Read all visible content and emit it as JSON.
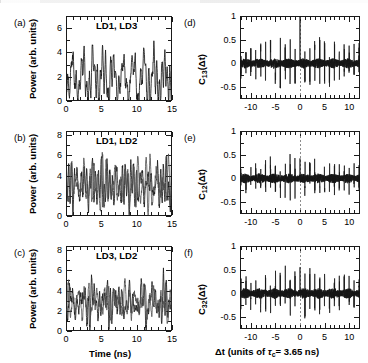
{
  "figure": {
    "background": "#ffffff",
    "trace_color": "#1a1a1a",
    "trace_color_secondary": "#4d4d4d",
    "axis_color": "#1a1a1a",
    "zero_line_color": "#8c8c8c"
  },
  "panels": [
    {
      "id": "a",
      "letter": "(a)",
      "inline_label": "LD1, LD3",
      "inline_label_bold_part": "LD1",
      "inline_label_rest": ", LD3",
      "ylabel": "Power (arb. units)",
      "yticks": [
        "0",
        "2",
        "4",
        "6"
      ],
      "ytick_values": [
        0,
        2,
        4,
        6
      ],
      "ylim": [
        0,
        7
      ],
      "xticks": [
        "0",
        "5",
        "10",
        "15"
      ],
      "xtick_values": [
        0,
        5,
        10,
        15
      ],
      "xlim": [
        0,
        15
      ],
      "xlabel": "",
      "n_traces": 1,
      "seed": 11,
      "mean": 1.9,
      "amp": 1.25
    },
    {
      "id": "b",
      "letter": "(b)",
      "inline_label": "LD1, LD2",
      "inline_label_bold_part": "LD1",
      "inline_label_rest": ", LD2",
      "ylabel": "Power (arb. units)",
      "yticks": [
        "0",
        "2",
        "4",
        "6",
        "8"
      ],
      "ytick_values": [
        0,
        2,
        4,
        6,
        8
      ],
      "ylim": [
        0,
        8.4
      ],
      "xticks": [
        "0",
        "5",
        "10",
        "15"
      ],
      "xtick_values": [
        0,
        5,
        10,
        15
      ],
      "xlim": [
        0,
        15
      ],
      "xlabel": "",
      "n_traces": 2,
      "seed": 23,
      "mean": 3.1,
      "amp": 1.3
    },
    {
      "id": "c",
      "letter": "(c)",
      "inline_label": "LD3, LD2",
      "inline_label_bold_part": "LD3",
      "inline_label_rest": ", LD2",
      "ylabel": "Power (arb. units)",
      "yticks": [
        "0",
        "2",
        "4",
        "6",
        "8"
      ],
      "ytick_values": [
        0,
        2,
        4,
        6,
        8
      ],
      "ylim": [
        0,
        8.4
      ],
      "xticks": [
        "0",
        "5",
        "10",
        "15"
      ],
      "xtick_values": [
        0,
        5,
        10,
        15
      ],
      "xlim": [
        0,
        15
      ],
      "xlabel": "Time (ns)",
      "n_traces": 2,
      "seed": 41,
      "mean": 2.85,
      "amp": 1.15
    },
    {
      "id": "d",
      "letter": "(d)",
      "inline_label": "",
      "ylabel_pre": "C",
      "ylabel_sub": "13",
      "ylabel_post": "(Δt)",
      "yticks": [
        "1",
        "0.5",
        "0",
        "-0.5"
      ],
      "ytick_values": [
        1,
        0.5,
        0,
        -0.5
      ],
      "ylim": [
        -0.75,
        1
      ],
      "xticks": [
        "-10",
        "-5",
        "0",
        "5",
        "10"
      ],
      "xtick_values": [
        -10,
        -5,
        0,
        5,
        10
      ],
      "xlim": [
        -12.2,
        12.2
      ],
      "xlabel": "",
      "seed": 7,
      "noise": 0.085,
      "center_peak": 0.98,
      "comb_period": 1.0,
      "comb_amp": 0.5
    },
    {
      "id": "e",
      "letter": "(e)",
      "inline_label": "",
      "ylabel_pre": "C",
      "ylabel_sub": "12",
      "ylabel_post": "(Δt)",
      "yticks": [
        "1",
        "0.5",
        "0",
        "-0.5"
      ],
      "ytick_values": [
        1,
        0.5,
        0,
        -0.5
      ],
      "ylim": [
        -0.75,
        1
      ],
      "xticks": [
        "-10",
        "-5",
        "0",
        "5",
        "10"
      ],
      "xtick_values": [
        -10,
        -5,
        0,
        5,
        10
      ],
      "xlim": [
        -12.2,
        12.2
      ],
      "xlabel": "",
      "seed": 19,
      "noise": 0.082,
      "center_peak": 0.42,
      "comb_period": 1.0,
      "comb_amp": 0.38
    },
    {
      "id": "f",
      "letter": "(f)",
      "inline_label": "",
      "ylabel_pre": "C",
      "ylabel_sub": "32",
      "ylabel_post": "(Δt)",
      "yticks": [
        "1",
        "0.5",
        "0",
        "-0.5"
      ],
      "ytick_values": [
        1,
        0.5,
        0,
        -0.5
      ],
      "ylim": [
        -0.75,
        1
      ],
      "xticks": [
        "-10",
        "-5",
        "0",
        "5",
        "10"
      ],
      "xtick_values": [
        -10,
        -5,
        0,
        5,
        10
      ],
      "xlim": [
        -12.2,
        12.2
      ],
      "xlabel_parts": {
        "pre": "Δt (units of ",
        "tau": "τ",
        "tau_sub": "c",
        "post": "= 3.65 ns)"
      },
      "seed": 31,
      "noise": 0.088,
      "center_peak": 0.55,
      "comb_period": 1.0,
      "comb_amp": 0.42
    }
  ],
  "chart_data": {
    "type": "line",
    "title": "",
    "panel_count": 6,
    "left_column": {
      "ylabel": "Power (arb. units)",
      "xlabel": "Time (ns)",
      "xlim": [
        0,
        15
      ],
      "xticks": [
        0,
        5,
        10,
        15
      ],
      "panels": [
        {
          "label": "(a)",
          "legend": "LD1, LD3",
          "ylim": [
            0,
            7
          ],
          "yticks": [
            0,
            2,
            4,
            6
          ],
          "series": [
            {
              "name": "LD1",
              "description": "chaotic intensity time series, mean ~1.9, peaks to ~5",
              "mean": 1.9,
              "peak_max": 5.0,
              "peak_min": 0.1
            }
          ]
        },
        {
          "label": "(b)",
          "legend": "LD1, LD2",
          "ylim": [
            0,
            8.4
          ],
          "yticks": [
            0,
            2,
            4,
            6,
            8
          ],
          "series": [
            {
              "name": "LD1",
              "description": "chaotic intensity time series, mean ~3.1, peaks to ~6.4",
              "mean": 3.1,
              "peak_max": 6.4,
              "peak_min": 0.6
            },
            {
              "name": "LD2",
              "description": "chaotic intensity time series overlaid, mean ~3.0",
              "mean": 3.0,
              "peak_max": 6.1,
              "peak_min": 0.8
            }
          ]
        },
        {
          "label": "(c)",
          "legend": "LD3, LD2",
          "ylim": [
            0,
            8.4
          ],
          "yticks": [
            0,
            2,
            4,
            6,
            8
          ],
          "series": [
            {
              "name": "LD3",
              "description": "chaotic intensity time series, mean ~2.85",
              "mean": 2.85,
              "peak_max": 6.0,
              "peak_min": 0.4
            },
            {
              "name": "LD2",
              "description": "chaotic intensity time series overlaid, mean ~2.8",
              "mean": 2.8,
              "peak_max": 5.8,
              "peak_min": 0.5
            }
          ]
        }
      ]
    },
    "right_column": {
      "xlabel": "Δt (units of τc = 3.65 ns)",
      "xlim": [
        -12.2,
        12.2
      ],
      "xticks": [
        -10,
        -5,
        0,
        5,
        10
      ],
      "ylim": [
        -0.75,
        1
      ],
      "yticks": [
        1,
        0.5,
        0,
        -0.5
      ],
      "tau_c_ns": 3.65,
      "zero_reference_line": true,
      "panels": [
        {
          "label": "(d)",
          "ylabel": "C13(Δt)",
          "description": "cross-correlation with periodic comb of peaks spaced 1 tau_c; central peak highest",
          "center_peak": 0.98,
          "side_peak_typical": 0.5,
          "noise_band": 0.085,
          "comb_spacing": 1.0
        },
        {
          "label": "(e)",
          "ylabel": "C12(Δt)",
          "description": "cross-correlation with periodic comb of peaks spaced 1 tau_c; peaks ~0.4-0.5",
          "center_peak": 0.42,
          "side_peak_typical": 0.38,
          "noise_band": 0.082,
          "comb_spacing": 1.0
        },
        {
          "label": "(f)",
          "ylabel": "C32(Δt)",
          "description": "cross-correlation with periodic comb of peaks spaced 1 tau_c; peaks ~0.5",
          "center_peak": 0.55,
          "side_peak_typical": 0.42,
          "noise_band": 0.088,
          "comb_spacing": 1.0
        }
      ]
    }
  }
}
